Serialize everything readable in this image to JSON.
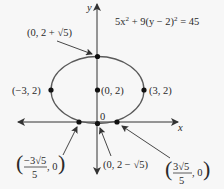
{
  "equation": {
    "text": "5x² + 9(y − 2)² = 45",
    "part1": "5x",
    "sup1": "2",
    "part2": " + 9(y − 2)",
    "sup2": "2",
    "part3": " = 45"
  },
  "axes": {
    "x_label": "x",
    "y_label": "y",
    "origin_label": "0"
  },
  "points": {
    "top": {
      "label_prefix": "(0, 2 + ",
      "sqrt": "√5",
      "label_suffix": ")",
      "full": "(0, 2 + √5)"
    },
    "center": {
      "label": "(0, 2)"
    },
    "left": {
      "label": "(−3, 2)"
    },
    "right": {
      "label": "(3, 2)"
    },
    "bottom": {
      "label_prefix": "(0, 2 − ",
      "sqrt": "√5",
      "label_suffix": ")",
      "full": "(0, 2 − √5)"
    },
    "x_int_left": {
      "numerator": "−3√5",
      "denominator": "5",
      "second": ", 0",
      "full": "(−3√5/5, 0)"
    },
    "x_int_right": {
      "numerator": "3√5",
      "denominator": "5",
      "second": ", 0",
      "full": "(3√5/5, 0)"
    }
  },
  "colors": {
    "ellipse": "#5a5a5a",
    "axis": "#333333",
    "point": "#111111",
    "background": "#f7f7f7"
  }
}
